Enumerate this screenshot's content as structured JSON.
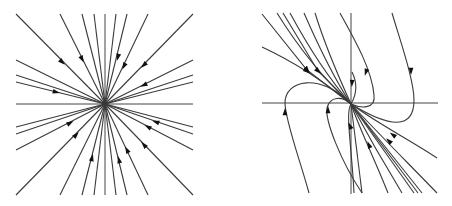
{
  "figure": {
    "panels": [
      {
        "id": "left",
        "title": "",
        "kind": "star-node-sink",
        "origin": [
          105,
          104
        ],
        "axes": {
          "x": [
            16,
            193
          ],
          "y": [
            14,
            195
          ]
        },
        "rays_to": [
          [
            16,
            14
          ],
          [
            60,
            14
          ],
          [
            82,
            14
          ],
          [
            94,
            14
          ],
          [
            116,
            14
          ],
          [
            127,
            14
          ],
          [
            148,
            14
          ],
          [
            193,
            14
          ],
          [
            16,
            60
          ],
          [
            16,
            75
          ],
          [
            16,
            82
          ],
          [
            16,
            127
          ],
          [
            16,
            134
          ],
          [
            16,
            150
          ],
          [
            16,
            195
          ],
          [
            193,
            60
          ],
          [
            193,
            75
          ],
          [
            193,
            82
          ],
          [
            193,
            127
          ],
          [
            193,
            134
          ],
          [
            193,
            150
          ],
          [
            193,
            195
          ],
          [
            60,
            195
          ],
          [
            82,
            195
          ],
          [
            94,
            195
          ],
          [
            116,
            195
          ],
          [
            127,
            195
          ],
          [
            148,
            195
          ]
        ],
        "arrows": [
          [
            62,
            62
          ],
          [
            82,
            59
          ],
          [
            118,
            57
          ],
          [
            124,
            66
          ],
          [
            144,
            65
          ],
          [
            144,
            85
          ],
          [
            56,
            92
          ],
          [
            70,
            123
          ],
          [
            76,
            135
          ],
          [
            92,
            158
          ],
          [
            119,
            160
          ],
          [
            127,
            150
          ],
          [
            148,
            127
          ],
          [
            156,
            122
          ],
          [
            144,
            145
          ]
        ]
      },
      {
        "id": "right",
        "title": "",
        "kind": "improper-node-sink",
        "origin": [
          350,
          104
        ],
        "axes": {
          "x": [
            262,
            438
          ],
          "y": [
            13,
            194
          ]
        },
        "arrows": [
          [
            307,
            71
          ],
          [
            318,
            71
          ],
          [
            366,
            72
          ],
          [
            411,
            71
          ],
          [
            352,
            83
          ],
          [
            285,
            112
          ],
          [
            328,
            110
          ],
          [
            350,
            126
          ],
          [
            369,
            145
          ],
          [
            389,
            141
          ],
          [
            393,
            135
          ]
        ]
      }
    ]
  }
}
